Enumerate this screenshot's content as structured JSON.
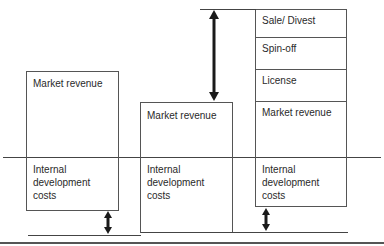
{
  "diagram": {
    "scenario_1": {
      "revenue_label": "Market revenue",
      "cost_label": "Internal development costs",
      "cost_lines": [
        "Internal",
        "development",
        "costs"
      ]
    },
    "scenario_2": {
      "revenue_label": "Market revenue",
      "cost_label": "Internal development costs",
      "cost_lines": [
        "Internal",
        "development",
        "costs"
      ]
    },
    "scenario_3": {
      "revenue_segments": [
        {
          "label": "Sale/ Divest"
        },
        {
          "label": "Spin-off"
        },
        {
          "label": "License"
        },
        {
          "label": "Market revenue"
        }
      ],
      "cost_lines": [
        "Internal",
        "development",
        "costs"
      ]
    },
    "colors": {
      "line": "#444444",
      "arrow": "#1a1a1a",
      "background": "#ffffff"
    }
  }
}
